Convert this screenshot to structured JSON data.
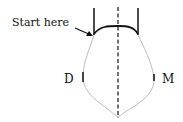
{
  "labels": {
    "start": "Start here",
    "left": "D",
    "right": "M"
  },
  "colors": {
    "ink": "#111111",
    "outline": "#b8b8b8"
  }
}
